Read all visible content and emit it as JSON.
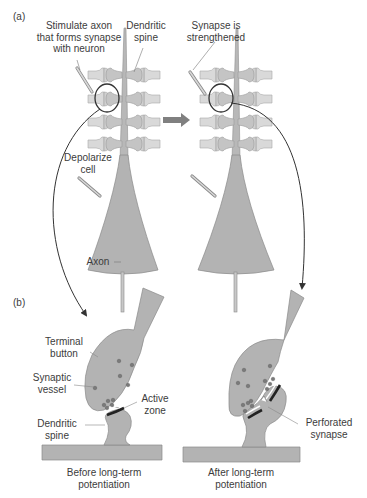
{
  "figure": {
    "panel_a": {
      "tag": "(a)",
      "labels": {
        "stimulate_l1": "Stimulate axon",
        "stimulate_l2": "that forms synapse",
        "stimulate_l3": "with neuron",
        "dendritic_l1": "Dendritic",
        "dendritic_l2": "spine",
        "strengthened_l1": "Synapse is",
        "strengthened_l2": "strengthened",
        "depolarize_l1": "Depolarize",
        "depolarize_l2": "cell",
        "axon": "Axon"
      }
    },
    "panel_b": {
      "tag": "(b)",
      "labels": {
        "terminal_l1": "Terminal",
        "terminal_l2": "button",
        "vessel_l1": "Synaptic",
        "vessel_l2": "vessel",
        "active_l1": "Active",
        "active_l2": "zone",
        "dspine_l1": "Dendritic",
        "dspine_l2": "spine",
        "perforated_l1": "Perforated",
        "perforated_l2": "synapse",
        "before_l1": "Before long-term",
        "before_l2": "potentiation",
        "after_l1": "After long-term",
        "after_l2": "potentiation"
      }
    },
    "colors": {
      "cell_fill": "#b3b3b3",
      "cell_stroke": "#8a8a8a",
      "spine_fill": "#d6d6d6",
      "vesicle": "#7a7a7a",
      "ink": "#333333",
      "arrow": "#7f7f7f"
    }
  }
}
